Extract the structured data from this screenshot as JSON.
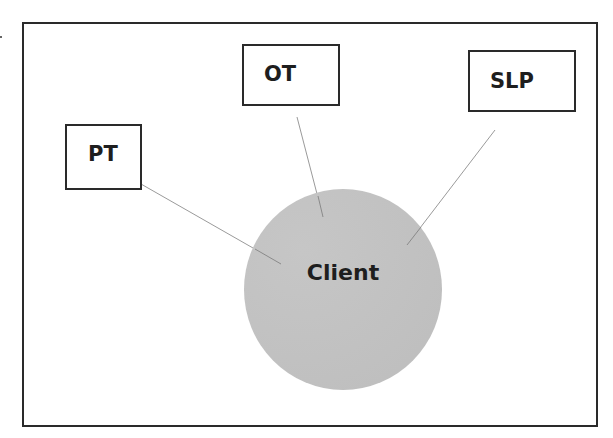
{
  "diagram": {
    "center": {
      "label": "Client",
      "shape": "circle",
      "fill": "#c1c1c1"
    },
    "nodes": [
      {
        "id": "pt",
        "label": "PT"
      },
      {
        "id": "ot",
        "label": "OT"
      },
      {
        "id": "slp",
        "label": "SLP"
      }
    ],
    "edges": [
      {
        "from": "PT",
        "to": "Client"
      },
      {
        "from": "OT",
        "to": "Client"
      },
      {
        "from": "SLP",
        "to": "Client"
      }
    ],
    "colors": {
      "border": "#2a2a2a",
      "connector": "#9a9a9a",
      "text": "#1e1e1e",
      "background": "#ffffff"
    }
  }
}
